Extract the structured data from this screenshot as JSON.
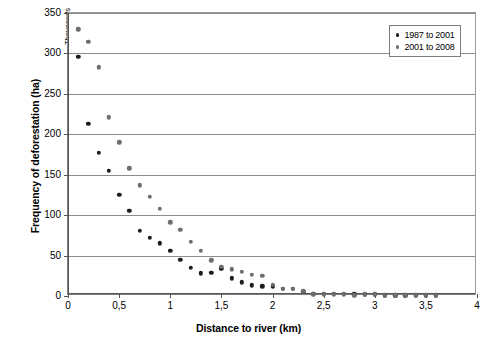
{
  "chart_data": {
    "type": "scatter",
    "title": "",
    "xlabel": "Distance to river (km)",
    "ylabel": "Frequency of deforestation (ha)",
    "y_unit_label": "Thousands",
    "xlim": [
      0,
      4
    ],
    "ylim": [
      0,
      350
    ],
    "xticks": [
      0,
      0.5,
      1,
      1.5,
      2,
      2.5,
      3,
      3.5,
      4
    ],
    "xtick_labels": [
      "0",
      "0,5",
      "1",
      "1,5",
      "2",
      "2,5",
      "3",
      "3,5",
      "4"
    ],
    "yticks": [
      0,
      50,
      100,
      150,
      200,
      250,
      300,
      350
    ],
    "ytick_labels": [
      "0",
      "50",
      "100",
      "150",
      "200",
      "250",
      "300",
      "350"
    ],
    "grid": "horizontal",
    "legend_position": "top-right",
    "decimal_separator": ",",
    "series": [
      {
        "name": "1987 to 2001",
        "color": "#1c1c1c",
        "x": [
          0.1,
          0.2,
          0.3,
          0.4,
          0.5,
          0.6,
          0.7,
          0.8,
          0.9,
          1.0,
          1.1,
          1.2,
          1.3,
          1.4,
          1.5,
          1.6,
          1.7,
          1.8,
          1.9,
          2.0,
          2.1,
          2.2,
          2.3,
          2.4,
          2.5,
          2.6,
          2.7,
          2.8,
          2.9,
          3.0,
          3.1,
          3.2,
          3.3,
          3.4,
          3.5,
          3.6
        ],
        "y": [
          296,
          213,
          177,
          155,
          125,
          105,
          81,
          72,
          65,
          56,
          45,
          35,
          28,
          29,
          34,
          22,
          17,
          13,
          12,
          12,
          9,
          9,
          5,
          3,
          3,
          3,
          3,
          2,
          2,
          2,
          1,
          1,
          1,
          1,
          1,
          1
        ]
      },
      {
        "name": "2001 to 2008",
        "color": "#6e6e6e",
        "x": [
          0.1,
          0.2,
          0.3,
          0.4,
          0.5,
          0.6,
          0.7,
          0.8,
          0.9,
          1.0,
          1.1,
          1.2,
          1.3,
          1.4,
          1.5,
          1.6,
          1.7,
          1.8,
          1.9,
          2.0,
          2.1,
          2.2,
          2.3,
          2.4,
          2.5,
          2.6,
          2.7,
          2.8,
          2.9,
          3.0,
          3.1,
          3.2,
          3.3,
          3.4,
          3.5,
          3.6
        ],
        "y": [
          330,
          314,
          283,
          221,
          190,
          158,
          137,
          123,
          108,
          91,
          82,
          67,
          56,
          44,
          36,
          33,
          30,
          26,
          25,
          14,
          9,
          9,
          6,
          2,
          2,
          2,
          2,
          1,
          2,
          2,
          1,
          1,
          1,
          1,
          1,
          1
        ]
      }
    ]
  },
  "legend": {
    "items": [
      {
        "label": "1987 to 2001"
      },
      {
        "label": "2001 to 2008"
      }
    ]
  }
}
